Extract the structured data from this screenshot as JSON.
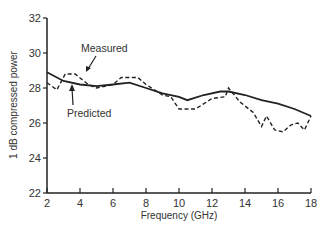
{
  "chart_data": {
    "type": "line",
    "title": "",
    "xlabel": "Frequency (GHz)",
    "ylabel": "1 dB compressed power",
    "xlim": [
      2,
      18
    ],
    "ylim": [
      22,
      32
    ],
    "xticks": [
      2,
      4,
      6,
      8,
      10,
      12,
      14,
      16,
      18
    ],
    "yticks": [
      22,
      24,
      26,
      28,
      30,
      32
    ],
    "grid": false,
    "legend": "annotations",
    "series": [
      {
        "name": "Predicted",
        "style": "solid",
        "x": [
          2,
          3,
          4,
          5,
          6,
          7,
          8,
          9,
          10,
          10.5,
          11.5,
          12.5,
          13,
          14,
          15,
          16,
          17,
          18
        ],
        "y": [
          28.9,
          28.4,
          28.2,
          28.1,
          28.2,
          28.3,
          28.0,
          27.7,
          27.5,
          27.3,
          27.6,
          27.8,
          27.8,
          27.6,
          27.3,
          27.1,
          26.8,
          26.4
        ]
      },
      {
        "name": "Measured",
        "style": "dashed",
        "x": [
          2,
          2.6,
          3.1,
          3.7,
          4.5,
          5,
          6,
          6.5,
          7.5,
          8,
          9,
          9.5,
          10,
          11,
          12,
          12.8,
          13,
          13.7,
          14.5,
          15,
          15.3,
          15.8,
          16.3,
          16.8,
          17.2,
          17.6,
          18
        ],
        "y": [
          28.3,
          27.9,
          28.8,
          28.8,
          28.2,
          28.0,
          28.2,
          28.6,
          28.6,
          28.2,
          27.6,
          27.5,
          26.8,
          26.8,
          27.4,
          27.5,
          28.0,
          27.2,
          26.6,
          25.8,
          26.4,
          25.6,
          25.5,
          25.9,
          26.0,
          25.6,
          26.4
        ]
      }
    ],
    "annotations": [
      {
        "text": "Measured",
        "arrow_to": [
          3.5,
          28.8
        ]
      },
      {
        "text": "Predicted",
        "arrow_to": [
          3.6,
          28.3
        ]
      }
    ]
  },
  "labels": {
    "xlabel": "Frequency (GHz)",
    "ylabel": "1 dB compressed power",
    "measured": "Measured",
    "predicted": "Predicted"
  }
}
